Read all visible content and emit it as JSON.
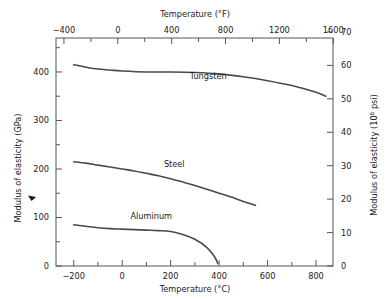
{
  "chart_data": {
    "type": "line",
    "title": "",
    "xlabel": "Temperature (°C)",
    "ylabel": "Modulus of elasticity (GPa)",
    "xlabel_secondary": "Temperature (°F)",
    "ylabel_secondary_pre": "Modulus of elasticity (10",
    "ylabel_secondary_sup": "6",
    "ylabel_secondary_post": " psi)",
    "xlim": [
      -273,
      870
    ],
    "ylim": [
      0,
      470
    ],
    "xlim_f": [
      -459,
      1598
    ],
    "ylim_psi": [
      0,
      68.2
    ],
    "grid": false,
    "legend": "inline-annotations",
    "x_ticks": [
      -200,
      0,
      200,
      400,
      600,
      800
    ],
    "x_tick_labels": [
      "−200",
      "0",
      "200",
      "400",
      "600",
      "800"
    ],
    "x_minor_ticks": [
      -100,
      100,
      300,
      500,
      700
    ],
    "x_ticks_f": [
      -400,
      0,
      400,
      800,
      1200,
      1600
    ],
    "x_tick_labels_f": [
      "−400",
      "0",
      "400",
      "800",
      "1200",
      "1600"
    ],
    "x_minor_ticks_f": [
      -200,
      200,
      600,
      1000,
      1400
    ],
    "y_ticks": [
      0,
      100,
      200,
      300,
      400
    ],
    "y_tick_labels": [
      "0",
      "100",
      "200",
      "300",
      "400"
    ],
    "y_minor_ticks": [
      50,
      150,
      250,
      350,
      450
    ],
    "y_ticks_psi": [
      0,
      10,
      20,
      30,
      40,
      50,
      60,
      70
    ],
    "y_tick_labels_psi": [
      "0",
      "10",
      "20",
      "30",
      "40",
      "50",
      "60",
      "70"
    ],
    "marker_annotation_value": 140,
    "series": [
      {
        "name": "Tungsten",
        "color": "#4a4a4a",
        "label_x": 355,
        "label_y": 385,
        "points": [
          [
            -200,
            415
          ],
          [
            -150,
            410
          ],
          [
            -100,
            406
          ],
          [
            -50,
            404
          ],
          [
            0,
            402
          ],
          [
            100,
            400
          ],
          [
            200,
            400
          ],
          [
            300,
            399
          ],
          [
            400,
            396
          ],
          [
            500,
            390
          ],
          [
            600,
            382
          ],
          [
            700,
            372
          ],
          [
            800,
            358
          ],
          [
            840,
            350
          ]
        ]
      },
      {
        "name": "Steel",
        "color": "#4a4a4a",
        "label_x": 215,
        "label_y": 205,
        "points": [
          [
            -200,
            215
          ],
          [
            -150,
            212
          ],
          [
            -100,
            208
          ],
          [
            -50,
            204
          ],
          [
            0,
            200
          ],
          [
            50,
            196
          ],
          [
            100,
            191
          ],
          [
            150,
            186
          ],
          [
            200,
            180
          ],
          [
            250,
            173
          ],
          [
            300,
            166
          ],
          [
            350,
            158
          ],
          [
            400,
            150
          ],
          [
            450,
            142
          ],
          [
            500,
            133
          ],
          [
            550,
            125
          ]
        ]
      },
      {
        "name": "Aluminum",
        "color": "#4a4a4a",
        "label_x": 120,
        "label_y": 97,
        "points": [
          [
            -200,
            85
          ],
          [
            -150,
            82
          ],
          [
            -100,
            79
          ],
          [
            -50,
            77
          ],
          [
            0,
            76
          ],
          [
            50,
            75
          ],
          [
            100,
            74
          ],
          [
            150,
            73
          ],
          [
            200,
            71
          ],
          [
            250,
            65
          ],
          [
            300,
            55
          ],
          [
            350,
            38
          ],
          [
            380,
            20
          ],
          [
            395,
            5
          ]
        ]
      }
    ]
  }
}
